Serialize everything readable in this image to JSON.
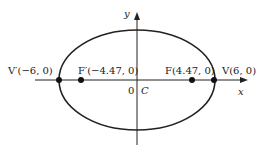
{
  "diagram": {
    "type": "ellipse",
    "axes": {
      "x_label": "x",
      "y_label": "y",
      "origin_label": "0",
      "center_label": "C"
    },
    "points": [
      {
        "name": "V'",
        "label": "V′(−6, 0)",
        "x": -6,
        "y": 0
      },
      {
        "name": "F'",
        "label": "F′(−4.47, 0)",
        "x": -4.47,
        "y": 0
      },
      {
        "name": "F",
        "label": "F(4.47, 0)",
        "x": 4.47,
        "y": 0
      },
      {
        "name": "V",
        "label": "V(6, 0)",
        "x": 6,
        "y": 0
      }
    ],
    "colors": {
      "stroke": "#222222",
      "background": "#ffffff"
    }
  }
}
